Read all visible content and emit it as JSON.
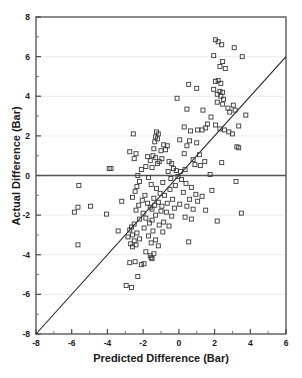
{
  "chart_data": {
    "type": "scatter",
    "title": "",
    "xlabel": "Predicted Difference (Bar)",
    "ylabel": "Actual Difference (Bar)",
    "xlim": [
      -8,
      6
    ],
    "ylim": [
      -8,
      8
    ],
    "xticks": [
      -8,
      -6,
      -4,
      -2,
      0,
      2,
      4,
      6
    ],
    "xtick_labels": [
      "-8",
      "-6",
      "-4",
      "-2",
      "0",
      "2",
      "4",
      "6"
    ],
    "yticks": [
      -8,
      -6,
      -4,
      -2,
      0,
      2,
      4,
      6,
      8
    ],
    "ytick_labels": [
      "-8",
      "-6",
      "-4",
      "-2",
      "0",
      "2",
      "4",
      "6",
      "8"
    ],
    "xminor_ticks": [
      -7,
      -5,
      -3,
      -1,
      1,
      3,
      5
    ],
    "yminor_ticks": [
      -7,
      -5,
      -3,
      -1,
      1,
      3,
      5,
      7
    ],
    "grid": true,
    "gridlines_y": [
      6,
      4,
      2,
      -2,
      -4,
      -6
    ],
    "legend": null,
    "marker": "open-square",
    "marker_size": 4,
    "marker_color": "#3a3a3a",
    "reference_lines": [
      {
        "name": "identity-line",
        "type": "diagonal",
        "from": [
          -8,
          -8
        ],
        "to": [
          6,
          6
        ],
        "color": "#222222"
      },
      {
        "name": "zero-line",
        "type": "horizontal",
        "y": 0,
        "color": "#555555"
      }
    ],
    "series": [
      {
        "name": "observations",
        "points": [
          [
            2.05,
            6.85
          ],
          [
            2.2,
            6.75
          ],
          [
            2.4,
            6.6
          ],
          [
            3.1,
            6.45
          ],
          [
            1.95,
            6.05
          ],
          [
            3.55,
            6.0
          ],
          [
            2.45,
            5.75
          ],
          [
            2.3,
            5.5
          ],
          [
            2.6,
            5.4
          ],
          [
            2.05,
            4.75
          ],
          [
            2.2,
            4.8
          ],
          [
            2.35,
            4.65
          ],
          [
            0.55,
            4.6
          ],
          [
            1.0,
            4.4
          ],
          [
            1.95,
            4.35
          ],
          [
            2.3,
            4.25
          ],
          [
            2.45,
            4.2
          ],
          [
            2.15,
            4.1
          ],
          [
            2.35,
            4.0
          ],
          [
            -0.1,
            3.9
          ],
          [
            2.5,
            3.85
          ],
          [
            2.15,
            3.7
          ],
          [
            2.45,
            3.6
          ],
          [
            3.05,
            3.55
          ],
          [
            2.75,
            3.4
          ],
          [
            0.45,
            3.35
          ],
          [
            1.35,
            3.3
          ],
          [
            3.15,
            3.3
          ],
          [
            2.85,
            3.2
          ],
          [
            3.75,
            3.05
          ],
          [
            1.8,
            2.95
          ],
          [
            1.6,
            2.6
          ],
          [
            2.05,
            2.55
          ],
          [
            3.35,
            2.5
          ],
          [
            0.3,
            2.45
          ],
          [
            1.5,
            2.4
          ],
          [
            1.05,
            2.3
          ],
          [
            1.3,
            2.3
          ],
          [
            2.3,
            2.35
          ],
          [
            2.55,
            2.3
          ],
          [
            0.65,
            2.25
          ],
          [
            2.8,
            2.2
          ],
          [
            -1.25,
            2.2
          ],
          [
            -1.15,
            2.1
          ],
          [
            -2.55,
            2.1
          ],
          [
            3.0,
            2.1
          ],
          [
            -1.3,
            1.95
          ],
          [
            -1.2,
            1.85
          ],
          [
            0.05,
            1.8
          ],
          [
            0.6,
            1.75
          ],
          [
            -1.35,
            1.7
          ],
          [
            1.0,
            1.65
          ],
          [
            -0.85,
            1.55
          ],
          [
            -0.65,
            1.5
          ],
          [
            0.45,
            1.5
          ],
          [
            3.25,
            1.45
          ],
          [
            3.35,
            1.4
          ],
          [
            -1.4,
            1.35
          ],
          [
            -0.75,
            1.3
          ],
          [
            -1.0,
            1.25
          ],
          [
            -2.75,
            1.2
          ],
          [
            -2.4,
            1.1
          ],
          [
            0.3,
            1.1
          ],
          [
            1.15,
            1.05
          ],
          [
            -1.45,
            1.0
          ],
          [
            -1.75,
            0.95
          ],
          [
            -1.3,
            0.9
          ],
          [
            -0.95,
            0.85
          ],
          [
            -2.5,
            0.85
          ],
          [
            0.8,
            0.8
          ],
          [
            -1.6,
            0.75
          ],
          [
            -1.1,
            0.7
          ],
          [
            -0.55,
            0.7
          ],
          [
            1.45,
            0.7
          ],
          [
            2.4,
            0.65
          ],
          [
            -1.2,
            0.6
          ],
          [
            -0.4,
            0.6
          ],
          [
            0.9,
            0.55
          ],
          [
            1.2,
            0.5
          ],
          [
            -1.85,
            0.45
          ],
          [
            -1.5,
            0.4
          ],
          [
            -3.9,
            0.35
          ],
          [
            -3.8,
            0.35
          ],
          [
            -0.3,
            0.35
          ],
          [
            0.35,
            0.3
          ],
          [
            -2.1,
            0.3
          ],
          [
            -0.15,
            0.25
          ],
          [
            0.1,
            0.2
          ],
          [
            -0.6,
            0.2
          ],
          [
            1.75,
            0.05
          ],
          [
            -2.3,
            0.0
          ],
          [
            -0.05,
            -0.05
          ],
          [
            -1.7,
            -0.1
          ],
          [
            -0.45,
            -0.15
          ],
          [
            0.15,
            -0.2
          ],
          [
            -2.2,
            -0.3
          ],
          [
            3.2,
            -0.3
          ],
          [
            -0.9,
            -0.35
          ],
          [
            0.4,
            -0.4
          ],
          [
            -1.55,
            -0.45
          ],
          [
            -0.2,
            -0.5
          ],
          [
            -5.6,
            -0.5
          ],
          [
            -2.35,
            -0.55
          ],
          [
            0.7,
            -0.6
          ],
          [
            -1.25,
            -0.65
          ],
          [
            -0.5,
            -0.7
          ],
          [
            1.85,
            -0.75
          ],
          [
            -2.45,
            -0.8
          ],
          [
            0.25,
            -0.85
          ],
          [
            -1.05,
            -0.9
          ],
          [
            0.95,
            -0.95
          ],
          [
            -0.8,
            -1.0
          ],
          [
            -1.9,
            -1.0
          ],
          [
            1.3,
            -1.05
          ],
          [
            -2.6,
            -1.1
          ],
          [
            -1.4,
            -1.15
          ],
          [
            -0.35,
            -1.2
          ],
          [
            0.6,
            -1.2
          ],
          [
            -2.05,
            -1.25
          ],
          [
            -3.2,
            -1.3
          ],
          [
            1.05,
            -1.3
          ],
          [
            -1.15,
            -1.35
          ],
          [
            -0.65,
            -1.4
          ],
          [
            -1.75,
            -1.4
          ],
          [
            0.05,
            -1.45
          ],
          [
            -2.25,
            -1.5
          ],
          [
            -1.35,
            -1.5
          ],
          [
            -0.95,
            -1.55
          ],
          [
            0.45,
            -1.55
          ],
          [
            -1.6,
            -1.6
          ],
          [
            -5.65,
            -1.6
          ],
          [
            -4.95,
            -1.55
          ],
          [
            -0.25,
            -1.65
          ],
          [
            -1.5,
            -1.7
          ],
          [
            0.8,
            -1.7
          ],
          [
            -2.4,
            -1.75
          ],
          [
            1.5,
            -1.75
          ],
          [
            -1.0,
            -1.8
          ],
          [
            -5.85,
            -1.85
          ],
          [
            -0.7,
            -1.85
          ],
          [
            -2.0,
            -1.9
          ],
          [
            3.5,
            -1.9
          ],
          [
            -4.05,
            -1.95
          ],
          [
            -1.3,
            -2.0
          ],
          [
            -0.4,
            -2.05
          ],
          [
            0.35,
            -2.1
          ],
          [
            -1.85,
            -2.15
          ],
          [
            -2.2,
            -2.2
          ],
          [
            0.7,
            -2.2
          ],
          [
            -1.5,
            -2.25
          ],
          [
            2.15,
            -2.3
          ],
          [
            -0.85,
            -2.35
          ],
          [
            -1.65,
            -2.4
          ],
          [
            -2.5,
            -2.45
          ],
          [
            -1.1,
            -2.5
          ],
          [
            -0.55,
            -2.55
          ],
          [
            -2.65,
            -2.6
          ],
          [
            -1.95,
            -2.65
          ],
          [
            -2.75,
            -2.75
          ],
          [
            -3.4,
            -2.8
          ],
          [
            -1.45,
            -2.8
          ],
          [
            -0.9,
            -2.85
          ],
          [
            -2.35,
            -2.9
          ],
          [
            -2.6,
            -3.0
          ],
          [
            -1.7,
            -3.05
          ],
          [
            -2.85,
            -3.1
          ],
          [
            -2.2,
            -3.2
          ],
          [
            -1.3,
            -3.25
          ],
          [
            -2.5,
            -3.3
          ],
          [
            0.55,
            -3.35
          ],
          [
            -1.55,
            -3.4
          ],
          [
            -2.7,
            -3.45
          ],
          [
            -2.4,
            -3.5
          ],
          [
            -5.65,
            -3.5
          ],
          [
            -1.15,
            -3.55
          ],
          [
            -2.6,
            -3.6
          ],
          [
            -1.85,
            -3.85
          ],
          [
            -1.4,
            -3.95
          ],
          [
            -1.6,
            -4.05
          ],
          [
            -1.55,
            -4.15
          ],
          [
            -1.5,
            -4.2
          ],
          [
            -2.45,
            -4.35
          ],
          [
            -2.75,
            -4.4
          ],
          [
            -1.95,
            -4.45
          ],
          [
            -2.1,
            -4.5
          ],
          [
            -2.3,
            -5.1
          ],
          [
            -2.95,
            -5.55
          ],
          [
            -2.65,
            -5.65
          ]
        ]
      }
    ]
  }
}
